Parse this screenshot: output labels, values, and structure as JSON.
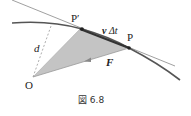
{
  "figure": {
    "caption": "図 6.8",
    "labels": {
      "p_prime": "P′",
      "p": "P",
      "origin": "O",
      "distance": "d",
      "displacement_v": "v",
      "displacement_dt": "Δt",
      "force": "F"
    },
    "colors": {
      "triangle_fill": "#c4c4c4",
      "curve": "#555555",
      "tangent": "#777777",
      "text": "#222222"
    }
  }
}
